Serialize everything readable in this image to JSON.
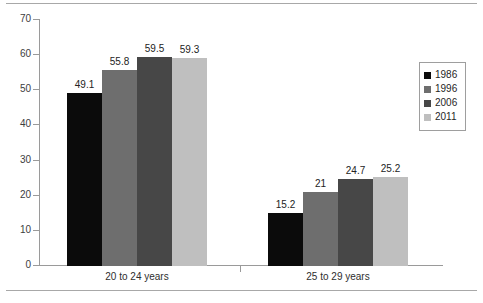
{
  "chart_data": {
    "type": "bar",
    "title": "",
    "subtitle": "",
    "xlabel": "",
    "ylabel": "",
    "ylim": [
      0,
      70
    ],
    "yticks": [
      0,
      10,
      20,
      30,
      40,
      50,
      60,
      70
    ],
    "grid": false,
    "legend_position": "right",
    "categories": [
      "20 to 24 years",
      "25 to 29 years"
    ],
    "series": [
      {
        "name": "1986",
        "color": "#0b0b0b",
        "values": [
          49.1,
          15.2
        ],
        "labels": [
          "49.1",
          "15.2"
        ]
      },
      {
        "name": "1996",
        "color": "#6e6e6e",
        "values": [
          55.8,
          21
        ],
        "labels": [
          "55.8",
          "21"
        ]
      },
      {
        "name": "2006",
        "color": "#474747",
        "values": [
          59.5,
          24.7
        ],
        "labels": [
          "59.5",
          "24.7"
        ]
      },
      {
        "name": "2011",
        "color": "#bfbfbf",
        "values": [
          59.3,
          25.2
        ],
        "labels": [
          "59.3",
          "25.2"
        ]
      }
    ]
  },
  "axis": {
    "y_tick_labels": [
      "70",
      "60",
      "50",
      "40",
      "30",
      "20",
      "10",
      "0"
    ],
    "category_labels": [
      "20 to 24 years",
      "25 to 29 years"
    ]
  },
  "legend": {
    "items": [
      {
        "label": "1986",
        "color": "#0b0b0b"
      },
      {
        "label": "1996",
        "color": "#6e6e6e"
      },
      {
        "label": "2006",
        "color": "#474747"
      },
      {
        "label": "2011",
        "color": "#bfbfbf"
      }
    ]
  },
  "colors": {
    "series_1986": "#0b0b0b",
    "series_1996": "#6e6e6e",
    "series_2006": "#474747",
    "series_2011": "#bfbfbf",
    "axis_line": "#9a9a9a",
    "frame_line": "#a8a8a8",
    "text": "#2e2e2e",
    "background": "#ffffff"
  }
}
